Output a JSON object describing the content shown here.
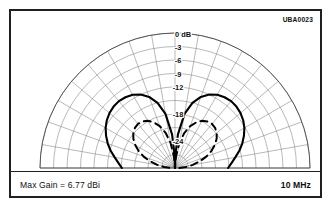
{
  "figure": {
    "id_code": "UBA0023",
    "max_gain_label": "Max Gain = 6.77 dBi",
    "frequency_label": "10 MHz"
  },
  "chart_data": {
    "type": "line",
    "plot_style": "polar-half-plane-radiation-pattern",
    "title": "",
    "subtitle": "",
    "xlabel": "",
    "ylabel": "",
    "annotations": [
      "UBA0023",
      "Max Gain = 6.77 dBi",
      "10 MHz"
    ],
    "max_gain_dbi": 6.77,
    "frequency_mhz": 10,
    "grid": true,
    "legend_position": "none",
    "radial_axis": {
      "label": "dB",
      "unit": "dB",
      "outer_value": 0,
      "center_value": -30,
      "range": [
        -30,
        0
      ],
      "ring_values": [
        0,
        -3,
        -6,
        -9,
        -12,
        -15,
        -18,
        -21,
        -24,
        -27
      ],
      "tick_labels": [
        "0 dB",
        "-3",
        "-6",
        "-9",
        "-12",
        "-18",
        "-24"
      ],
      "tick_label_values": [
        0,
        -3,
        -6,
        -9,
        -12,
        -18,
        -24
      ]
    },
    "angular_axis": {
      "unit": "degrees",
      "range": [
        0,
        180
      ],
      "spoke_step_deg": 10,
      "spokes_deg": [
        0,
        10,
        20,
        30,
        40,
        50,
        60,
        70,
        80,
        90,
        100,
        110,
        120,
        130,
        140,
        150,
        160,
        170,
        180
      ],
      "tick_labels": []
    },
    "series": [
      {
        "name": "elevation-pattern-solid",
        "style": "solid",
        "color": "#000000",
        "angles_deg": [
          0,
          5,
          10,
          15,
          20,
          25,
          30,
          35,
          40,
          45,
          50,
          55,
          60,
          65,
          70,
          75,
          80,
          85,
          88,
          90,
          92,
          95,
          100,
          105,
          110,
          115,
          120,
          125,
          130,
          135,
          140,
          145,
          150,
          155,
          160,
          165,
          170,
          175,
          180
        ],
        "values_db": [
          -18.2,
          -17.4,
          -16.4,
          -15.2,
          -14.1,
          -13.1,
          -12.2,
          -11.5,
          -11.0,
          -10.7,
          -10.6,
          -10.8,
          -11.2,
          -12.0,
          -13.2,
          -15.0,
          -17.8,
          -22.5,
          -27.0,
          -30.0,
          -27.0,
          -22.5,
          -17.8,
          -15.0,
          -13.2,
          -12.0,
          -11.2,
          -10.8,
          -10.6,
          -10.7,
          -11.0,
          -11.5,
          -12.2,
          -13.1,
          -14.1,
          -15.2,
          -16.4,
          -17.4,
          -18.2
        ]
      },
      {
        "name": "elevation-pattern-dashed",
        "style": "dashed",
        "color": "#000000",
        "angles_deg": [
          0,
          5,
          10,
          15,
          20,
          25,
          30,
          35,
          40,
          45,
          50,
          55,
          60,
          65,
          70,
          75,
          80,
          85,
          88,
          90,
          92,
          95,
          100,
          105,
          110,
          115,
          120,
          125,
          130,
          135,
          140,
          145,
          150,
          155,
          160,
          165,
          170,
          175,
          180
        ],
        "values_db": [
          -29.0,
          -27.6,
          -26.0,
          -24.3,
          -22.6,
          -21.1,
          -19.8,
          -18.7,
          -17.9,
          -17.4,
          -17.2,
          -17.4,
          -17.9,
          -18.8,
          -20.1,
          -21.9,
          -24.3,
          -27.4,
          -29.4,
          -30.0,
          -29.4,
          -27.4,
          -24.3,
          -21.9,
          -20.1,
          -18.8,
          -17.9,
          -17.4,
          -17.2,
          -17.4,
          -17.9,
          -18.7,
          -19.8,
          -21.1,
          -22.6,
          -24.3,
          -26.0,
          -27.6,
          -29.0
        ]
      }
    ]
  }
}
